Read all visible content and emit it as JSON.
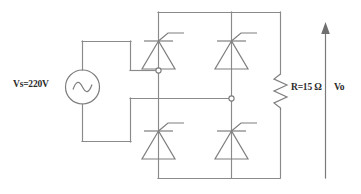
{
  "diagram": {
    "type": "circuit-schematic",
    "background_color": "#ffffff",
    "line_color": "#8a8a8a",
    "text_color": "#2b2b2b"
  },
  "labels": {
    "source": "Vs=220V",
    "resistor": "R=15 Ω",
    "output_voltage": "Vo"
  },
  "components": {
    "source": {
      "name": "ac-voltage-source",
      "symbol": "circle-with-sine-wave",
      "label": "Vs=220V",
      "value": "220V"
    },
    "resistor": {
      "name": "load-resistor",
      "symbol": "zigzag",
      "label": "R=15 Ω",
      "value": "15",
      "unit": "Ω"
    },
    "thyristors": [
      {
        "name": "thyristor-top-left",
        "symbol": "scr-triangle-up-with-gate",
        "position": "top-left"
      },
      {
        "name": "thyristor-top-right",
        "symbol": "scr-triangle-up-with-gate",
        "position": "top-right"
      },
      {
        "name": "thyristor-bottom-left",
        "symbol": "scr-triangle-up-with-gate",
        "position": "bottom-left"
      },
      {
        "name": "thyristor-bottom-right",
        "symbol": "scr-triangle-up-with-gate",
        "position": "bottom-right"
      }
    ],
    "nodes": [
      {
        "name": "node-ac-terminal-left",
        "symbol": "open-circle-junction"
      },
      {
        "name": "node-ac-terminal-right",
        "symbol": "open-circle-junction"
      }
    ],
    "output_arrow": {
      "name": "output-voltage-arrow",
      "symbol": "up-arrow",
      "direction": "up",
      "label": "Vo"
    }
  }
}
